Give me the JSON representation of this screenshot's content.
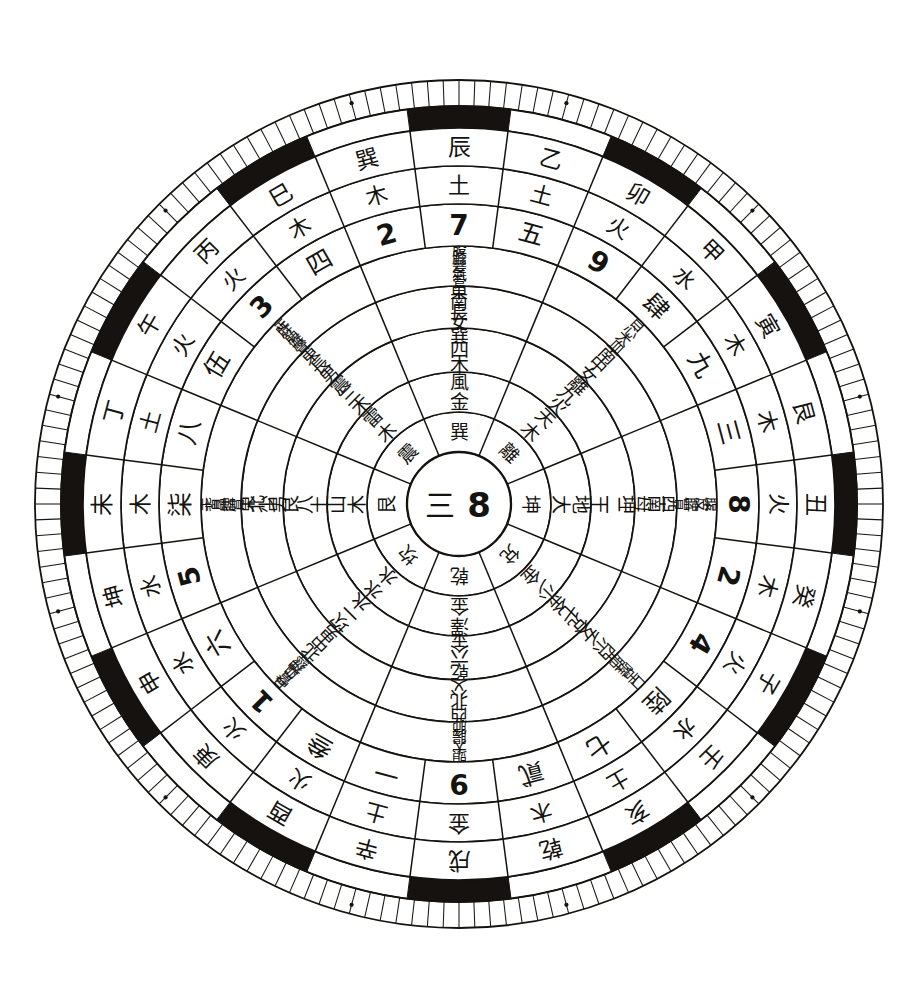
{
  "diagram": {
    "kind": "concentric-ring-chart",
    "background_color": "#ffffff",
    "ink_color": "#15130f",
    "center": {
      "cx": 459,
      "cy": 504
    },
    "outer_radius": 375
  },
  "center_disc": {
    "label_left": "三",
    "label_right": "8"
  },
  "rings": [
    {
      "id": "ring-bagua-name",
      "name": "Eight Trigram Names",
      "sectors": 8,
      "r_inner": 52,
      "r_outer": 92,
      "start_angle": 202.5,
      "font_size": 19,
      "cells": [
        "坎",
        "艮",
        "震",
        "巽",
        "離",
        "坤",
        "兌",
        "乾"
      ]
    },
    {
      "id": "ring-bagua-element",
      "name": "Trigram Image and Element",
      "sectors": 8,
      "r_inner": 92,
      "r_outer": 132,
      "start_angle": 202.5,
      "font_size": 19,
      "cells": [
        "水水",
        "山木",
        "雷木",
        "風金",
        "天木",
        "地大",
        "少金",
        "澤金"
      ]
    },
    {
      "id": "ring-number-element",
      "name": "Trigram Number and Five Element",
      "sectors": 8,
      "r_inner": 132,
      "r_outer": 176,
      "start_angle": 202.5,
      "font_size": 19,
      "cells": [
        "坎一水",
        "艮八土",
        "震三木",
        "巽四木",
        "離九火",
        "坤二土",
        "兌七金",
        "乾六金"
      ]
    },
    {
      "id": "ring-direction-family",
      "name": "Direction and Family Member",
      "sectors": 8,
      "r_inner": 176,
      "r_outer": 218,
      "start_angle": 202.5,
      "font_size": 18,
      "cells": [
        "北中男",
        "東北少男",
        "東長男",
        "東南長女",
        "南中女",
        "西南母",
        "西少女",
        "西北父"
      ]
    },
    {
      "id": "ring-body-organ",
      "name": "Body Parts and Organs",
      "sectors": 8,
      "r_inner": 218,
      "r_outer": 258,
      "start_angle": 202.5,
      "font_size": 15,
      "cells": [
        "耳腎血神經",
        "手背鼻脾胃",
        "足肝筋喉聲",
        "股膽髮氣管",
        "目心大血",
        "腹皮脾胃",
        "口舌喉肺",
        "頭大腸肺"
      ]
    },
    {
      "id": "ring-numeral",
      "name": "Flying Star Numerals",
      "sectors": 24,
      "r_inner": 258,
      "r_outer": 300,
      "start_angle": 187.5,
      "font_size": 25,
      "cells": [
        "一",
        "叁",
        "1",
        "六",
        "5",
        "柒",
        "八",
        "伍",
        "3",
        "四",
        "2",
        "7",
        "五",
        "9",
        "肆",
        "九",
        "三",
        "8",
        "2",
        "4",
        "陸",
        "七",
        "貳",
        "9"
      ]
    },
    {
      "id": "ring-element",
      "name": "Five Elements per Mountain",
      "sectors": 24,
      "r_inner": 300,
      "r_outer": 338,
      "start_angle": 187.5,
      "font_size": 22,
      "cells": [
        "土",
        "火",
        "火",
        "水",
        "水",
        "木",
        "土",
        "火",
        "火",
        "木",
        "木",
        "土",
        "土",
        "火",
        "水",
        "木",
        "木",
        "火",
        "木",
        "火",
        "水",
        "土",
        "木",
        "金"
      ]
    },
    {
      "id": "ring-stem-branch",
      "name": "Twenty-four Mountains (Stems, Branches, Trigrams)",
      "sectors": 24,
      "r_inner": 338,
      "r_outer": 376,
      "start_angle": 187.5,
      "font_size": 23,
      "cells": [
        "辛",
        "酉",
        "庚",
        "申",
        "坤",
        "未",
        "丁",
        "午",
        "丙",
        "巳",
        "巽",
        "辰",
        "乙",
        "卯",
        "甲",
        "寅",
        "艮",
        "丑",
        "癸",
        "子",
        "壬",
        "亥",
        "乾",
        "戌"
      ]
    }
  ],
  "outer_band": {
    "id": "ring-black-white-band",
    "name": "Alternating Black and White Segments",
    "r_inner": 376,
    "r_outer": 398,
    "segment_count": 24,
    "black_fill": "#151210",
    "white_fill": "#ffffff"
  },
  "graduation_ring": {
    "id": "ring-degree-ticks",
    "name": "Degree Graduation Scale",
    "r_inner": 398,
    "r_outer": 424,
    "tick_count": 168,
    "marker_dots": 12
  },
  "legend_note": {
    "description": "Traditional Chinese geomancy plate with eight trigrams at center and twenty-four mountains on the rim"
  }
}
